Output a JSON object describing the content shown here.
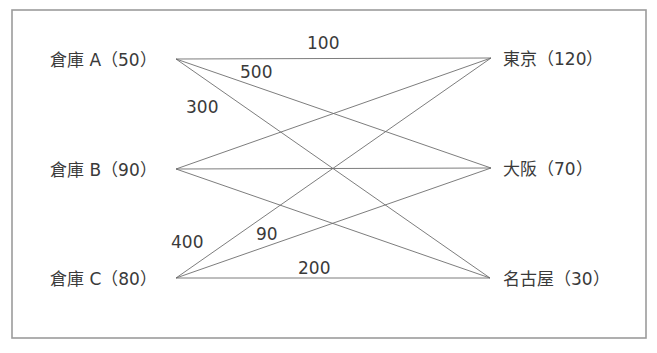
{
  "diagram": {
    "type": "transportation-network",
    "frame": {
      "x": 12,
      "y": 10,
      "width": 634,
      "height": 328,
      "stroke": "#9c9c9c"
    },
    "edge_color": "#6e6e6e",
    "text_color": "#3a3a3a",
    "sources": [
      {
        "id": "A",
        "label": "倉庫 A（50）",
        "name": "倉庫 A",
        "supply": 50,
        "x": 176,
        "y": 59,
        "label_x": 50,
        "label_y": 66
      },
      {
        "id": "B",
        "label": "倉庫 B（90）",
        "name": "倉庫 B",
        "supply": 90,
        "x": 176,
        "y": 169,
        "label_x": 50,
        "label_y": 176
      },
      {
        "id": "C",
        "label": "倉庫 C（80）",
        "name": "倉庫 C",
        "supply": 80,
        "x": 176,
        "y": 278,
        "label_x": 50,
        "label_y": 285
      }
    ],
    "destinations": [
      {
        "id": "Tokyo",
        "label": "東京（120）",
        "name": "東京",
        "demand": 120,
        "x": 491,
        "y": 58,
        "label_x": 503,
        "label_y": 65
      },
      {
        "id": "Osaka",
        "label": "大阪（70）",
        "name": "大阪",
        "demand": 70,
        "x": 491,
        "y": 168,
        "label_x": 503,
        "label_y": 175
      },
      {
        "id": "Nagoya",
        "label": "名古屋（30）",
        "name": "名古屋",
        "demand": 30,
        "x": 490,
        "y": 278,
        "label_x": 503,
        "label_y": 285
      }
    ],
    "edges": [
      {
        "from": "A",
        "to": "Tokyo",
        "cost": "100",
        "label_x": 307,
        "label_y": 49
      },
      {
        "from": "A",
        "to": "Osaka",
        "cost": "500",
        "label_x": 240,
        "label_y": 78
      },
      {
        "from": "A",
        "to": "Nagoya",
        "cost": "300",
        "label_x": 186,
        "label_y": 113
      },
      {
        "from": "B",
        "to": "Tokyo",
        "cost": ""
      },
      {
        "from": "B",
        "to": "Osaka",
        "cost": ""
      },
      {
        "from": "B",
        "to": "Nagoya",
        "cost": ""
      },
      {
        "from": "C",
        "to": "Tokyo",
        "cost": "400",
        "label_x": 171,
        "label_y": 248
      },
      {
        "from": "C",
        "to": "Osaka",
        "cost": "90",
        "label_x": 256,
        "label_y": 240
      },
      {
        "from": "C",
        "to": "Nagoya",
        "cost": "200",
        "label_x": 298,
        "label_y": 274
      }
    ]
  }
}
